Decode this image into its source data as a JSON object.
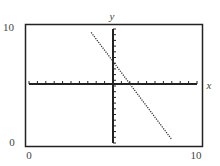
{
  "chart_data": {
    "type": "line",
    "title": "",
    "xlabel": "x",
    "ylabel": "y",
    "window_labels": {
      "x_min": "0",
      "x_max": "10",
      "y_min": "0",
      "y_max": "10"
    },
    "xlim": [
      0,
      10
    ],
    "ylim": [
      0,
      10
    ],
    "grid": false,
    "axis_ticks": {
      "x_count": 20,
      "y_count": 20
    },
    "series": [
      {
        "name": "line",
        "style": "dotted",
        "x": [
          3.7,
          8.5
        ],
        "y": [
          9.7,
          0.3
        ]
      }
    ]
  },
  "labels": {
    "x_axis": "x",
    "y_axis": "y",
    "x_min": "0",
    "x_max": "10",
    "y_min": "0",
    "y_max": "10"
  },
  "colors": {
    "frame": "#222222",
    "line": "#333333",
    "text": "#444444"
  }
}
